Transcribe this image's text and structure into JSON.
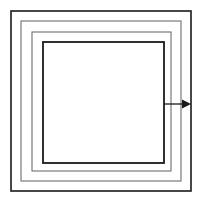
{
  "figure": {
    "background_color": "#ffffff",
    "width": 209,
    "height": 206
  },
  "chart_data": {
    "type": "diagram",
    "xlabel": "",
    "ylabel": "",
    "grid": false,
    "legend": null,
    "shapes": [
      {
        "id": "square-1-outer",
        "name": "outer-square",
        "kind": "square",
        "x": 11,
        "y": 11,
        "size": 180,
        "stroke_color": "#1a1a1a",
        "stroke_width": 1.6
      },
      {
        "id": "square-2",
        "name": "second-square",
        "kind": "square",
        "x": 21,
        "y": 21,
        "size": 160,
        "stroke_color": "#6e6e6e",
        "stroke_width": 1.1
      },
      {
        "id": "square-3",
        "name": "third-square",
        "kind": "square",
        "x": 32,
        "y": 32,
        "size": 139,
        "stroke_color": "#6e6e6e",
        "stroke_width": 1.1
      },
      {
        "id": "square-4-inner",
        "name": "inner-square",
        "kind": "square",
        "x": 43,
        "y": 42,
        "size": 121,
        "stroke_color": "#1a1a1a",
        "stroke_width": 1.8
      }
    ],
    "annotations": [
      {
        "id": "arrow-1",
        "name": "outward-arrow",
        "kind": "arrow",
        "label": "",
        "direction": "right",
        "x_start": 164,
        "y_start": 104,
        "x_end": 191,
        "y_end": 104,
        "stroke_color": "#1a1a1a",
        "stroke_width": 1.3,
        "head_length": 9,
        "head_width": 9
      }
    ],
    "axis_ranges": {
      "x": [
        0,
        209
      ],
      "y": [
        0,
        206
      ]
    }
  }
}
